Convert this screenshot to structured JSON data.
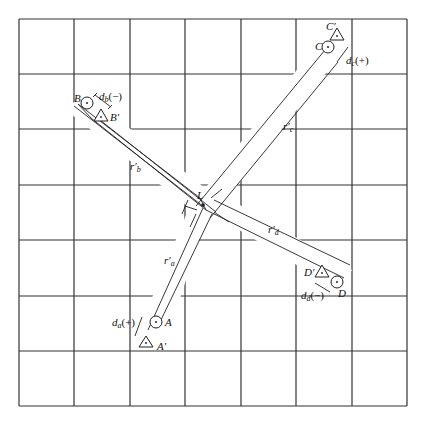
{
  "grid": {
    "columns": 7,
    "rows": 7
  },
  "center": {
    "label": "L"
  },
  "points": [
    {
      "id": "a",
      "label": "A",
      "prime_label": "A′",
      "radius_label": "r′",
      "radius_sub": "a",
      "disp_label": "d",
      "disp_sub": "a",
      "disp_sign": "(+)"
    },
    {
      "id": "b",
      "label": "B",
      "prime_label": "B′",
      "radius_label": "r′",
      "radius_sub": "b",
      "disp_label": "d",
      "disp_sub": "b",
      "disp_sign": "(−)"
    },
    {
      "id": "c",
      "label": "C",
      "prime_label": "C′",
      "radius_label": "r′",
      "radius_sub": "c",
      "disp_label": "d",
      "disp_sub": "c",
      "disp_sign": "(+)"
    },
    {
      "id": "d",
      "label": "D",
      "prime_label": "D′",
      "radius_label": "r′",
      "radius_sub": "d",
      "disp_label": "d",
      "disp_sub": "d",
      "disp_sign": "(−)"
    }
  ]
}
